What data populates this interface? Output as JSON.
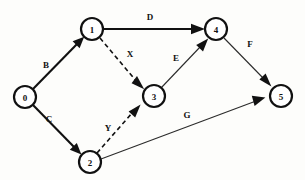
{
  "diagram": {
    "type": "directed-graph",
    "background_color": "#fdfdfb",
    "stroke_color": "#111111",
    "node_fill": "#ffffff",
    "nodes": [
      {
        "id": "0",
        "label": "0",
        "x": 25,
        "y": 97,
        "r": 11
      },
      {
        "id": "1",
        "label": "1",
        "x": 92,
        "y": 29,
        "r": 11
      },
      {
        "id": "2",
        "label": "2",
        "x": 90,
        "y": 162,
        "r": 11
      },
      {
        "id": "3",
        "label": "3",
        "x": 154,
        "y": 96,
        "r": 11
      },
      {
        "id": "4",
        "label": "4",
        "x": 216,
        "y": 29,
        "r": 11
      },
      {
        "id": "5",
        "label": "5",
        "x": 281,
        "y": 96,
        "r": 11
      }
    ],
    "edges": [
      {
        "id": "B",
        "label": "B",
        "from": "0",
        "to": "1",
        "style": "solid-thick",
        "label_x": 46,
        "label_y": 65
      },
      {
        "id": "C",
        "label": "C",
        "from": "0",
        "to": "2",
        "style": "solid-thick",
        "label_x": 49,
        "label_y": 119
      },
      {
        "id": "D",
        "label": "D",
        "from": "1",
        "to": "4",
        "style": "solid-thick",
        "label_x": 150,
        "label_y": 17
      },
      {
        "id": "X",
        "label": "X",
        "from": "1",
        "to": "3",
        "style": "dashed",
        "label_x": 130,
        "label_y": 54
      },
      {
        "id": "Y",
        "label": "Y",
        "from": "2",
        "to": "3",
        "style": "dashed",
        "label_x": 108,
        "label_y": 128
      },
      {
        "id": "E",
        "label": "E",
        "from": "3",
        "to": "4",
        "style": "solid-thin",
        "label_x": 176,
        "label_y": 58
      },
      {
        "id": "F",
        "label": "F",
        "from": "4",
        "to": "5",
        "style": "solid-thin",
        "label_x": 250,
        "label_y": 44
      },
      {
        "id": "G",
        "label": "G",
        "from": "2",
        "to": "5",
        "style": "solid-thin",
        "label_x": 187,
        "label_y": 115
      }
    ]
  }
}
